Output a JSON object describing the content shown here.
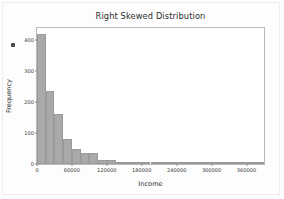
{
  "chart_data": {
    "type": "bar",
    "title": "Right Skewed Distribution",
    "xlabel": "Income",
    "ylabel": "Frequency",
    "grid": false,
    "legend": null,
    "xlim": [
      0,
      390000
    ],
    "ylim": [
      0,
      440
    ],
    "xticks": [
      0,
      60000,
      120000,
      180000,
      240000,
      300000,
      360000
    ],
    "xtick_labels": [
      "0",
      "60000",
      "120000",
      "180000",
      "240000",
      "300000",
      "360000"
    ],
    "yticks": [
      0,
      100,
      200,
      300,
      400
    ],
    "ytick_labels": [
      "0",
      "100",
      "200",
      "300",
      "400"
    ],
    "bin_width": 15000,
    "bin_starts": [
      0,
      15000,
      30000,
      45000,
      60000,
      75000,
      90000,
      105000,
      120000,
      135000,
      150000,
      165000,
      180000,
      195000,
      210000,
      225000,
      240000,
      255000,
      270000,
      285000,
      300000,
      315000,
      330000,
      345000,
      360000,
      375000
    ],
    "values": [
      420,
      235,
      163,
      82,
      48,
      36,
      36,
      14,
      14,
      8,
      5,
      5,
      3,
      2,
      2,
      2,
      3,
      1,
      1,
      1,
      1,
      1,
      1,
      1,
      1,
      1
    ],
    "bar_color": "#a9a9a9",
    "bar_edge_color": "#9a9a9a"
  },
  "figure": {
    "background_color": "#fdfdfd",
    "plot_background_color": "#ffffff",
    "axes_border_color": "#b9b9b9"
  }
}
